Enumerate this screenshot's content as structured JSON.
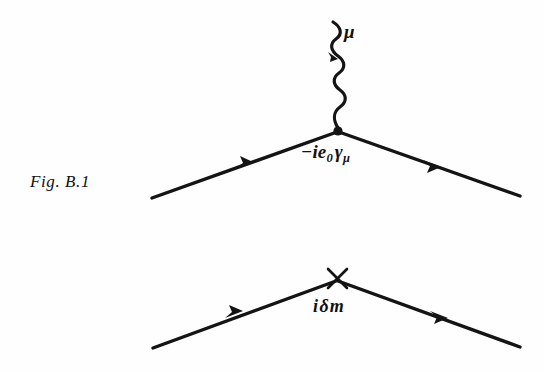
{
  "figure": {
    "caption": "Fig. B.1",
    "background_color": "#fefefe",
    "ink_color": "#111111"
  },
  "diagrams": [
    {
      "name": "qed-vertex",
      "description": "QED interaction vertex: two fermion lines meeting a wavy photon line at a filled dot vertex",
      "vertex": {
        "x": 338,
        "y": 131,
        "marker": "filled-dot"
      },
      "photon": {
        "index_label": "μ",
        "from": {
          "x": 333,
          "y": 22
        },
        "to": {
          "x": 338,
          "y": 131
        },
        "style": "wavy",
        "periods": 5,
        "amplitude": 6,
        "arrow_direction": "downward"
      },
      "fermion_in": {
        "from": {
          "x": 152,
          "y": 198
        },
        "to": {
          "x": 338,
          "y": 131
        },
        "arrow_at": {
          "x": 247,
          "y": 164
        },
        "arrow_direction": "toward-vertex"
      },
      "fermion_out": {
        "from": {
          "x": 338,
          "y": 131
        },
        "to": {
          "x": 520,
          "y": 196
        },
        "arrow_at": {
          "x": 433,
          "y": 165
        },
        "arrow_direction": "away-from-vertex"
      },
      "vertex_factor": {
        "text_plain": "-ie₀γμ",
        "sign": "−",
        "base_1": "ie",
        "sub_1": "0",
        "base_2": "γ",
        "sub_2": "μ"
      }
    },
    {
      "name": "mass-counterterm-vertex",
      "description": "Mass counterterm insertion: two fermion lines meeting at a cross mark",
      "vertex": {
        "x": 337,
        "y": 279,
        "marker": "cross"
      },
      "cross": {
        "size": 20
      },
      "fermion_in": {
        "from": {
          "x": 153,
          "y": 348
        },
        "to": {
          "x": 337,
          "y": 281
        },
        "arrow_at": {
          "x": 236,
          "y": 313
        },
        "arrow_direction": "toward-vertex"
      },
      "fermion_out": {
        "from": {
          "x": 337,
          "y": 281
        },
        "to": {
          "x": 520,
          "y": 347
        },
        "arrow_at": {
          "x": 440,
          "y": 316
        },
        "arrow_direction": "away-from-vertex"
      },
      "counterterm_factor": {
        "text_plain": "iδm",
        "symbol_1": "i",
        "symbol_2": "δ",
        "symbol_3": "m"
      }
    }
  ],
  "icons": {
    "vertex_dot": "filled-dot-icon",
    "vertex_cross": "cross-mark-icon",
    "arrowhead": "arrowhead-icon",
    "photon_wave": "wavy-line-icon"
  }
}
